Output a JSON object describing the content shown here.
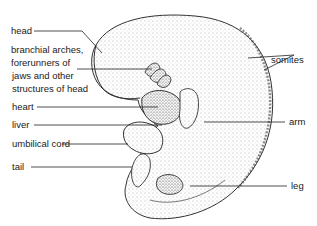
{
  "diagram": {
    "labels": {
      "head": "head",
      "branchial_1": "branchial arches,",
      "branchial_2": "forerunners of",
      "branchial_3": "jaws and other",
      "branchial_4": "structures of head",
      "heart": "heart",
      "liver": "liver",
      "umbilical": "umbilical cord",
      "tail": "tail",
      "somites": "somites",
      "arm": "arm",
      "leg": "leg"
    },
    "colors": {
      "ink": "#1a1a1a",
      "stipple": "#555555",
      "background": "#ffffff"
    }
  }
}
